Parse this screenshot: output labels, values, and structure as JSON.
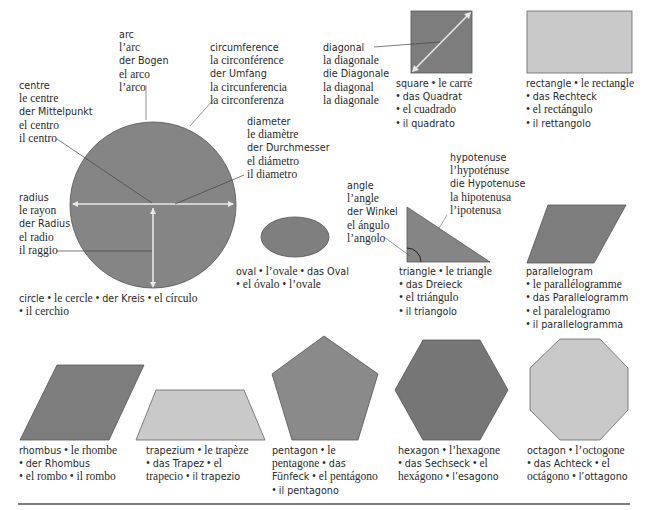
{
  "colors": {
    "dark_fill": "#7d7d7d",
    "medium_fill": "#8c8c8c",
    "light_fill": "#c8c8c8",
    "stroke": "#555555",
    "leader_line": "#444444",
    "arrow": "#e6e6e6",
    "rule": "#555555"
  },
  "circle_parts": {
    "arc": [
      "arc",
      "l’arc",
      "der Bogen",
      "el arco",
      "l’arco"
    ],
    "circumference": [
      "circumference",
      "la circonférence",
      "der Umfang",
      "la circunferencia",
      "la circonferenza"
    ],
    "centre": [
      "centre",
      "le centre",
      "der Mittelpunkt",
      "el centro",
      "il centro"
    ],
    "diameter": [
      "diameter",
      "le diamètre",
      "der Durchmesser",
      "el diámetro",
      "il diametro"
    ],
    "radius": [
      "radius",
      "le rayon",
      "der Radius",
      "el radio",
      "il raggio"
    ]
  },
  "diagonal": [
    "diagonal",
    "la diagonale",
    "die Diagonale",
    "la diagonal",
    "la diagonale"
  ],
  "angle": [
    "angle",
    "l’angle",
    "der Winkel",
    "el ángulo",
    "l’angolo"
  ],
  "hypotenuse": [
    "hypotenuse",
    "l’hypoténuse",
    "die Hypotenuse",
    "la hipotenusa",
    "l’ipotenusa"
  ],
  "shapes": {
    "circle": {
      "en": "circle",
      "fr": "le cercle",
      "de": "der Kreis",
      "es": "el círculo",
      "it": "il cerchio"
    },
    "oval": {
      "en": "oval",
      "fr": "l’ovale",
      "de": "das Oval",
      "es": "el óvalo",
      "it": "l’ovale"
    },
    "square": {
      "en": "square",
      "fr": "le carré",
      "de": "das Quadrat",
      "es": "el cuadrado",
      "it": "il quadrato"
    },
    "rectangle": {
      "en": "rectangle",
      "fr": "le rectangle",
      "de": "das Rechteck",
      "es": "el rectángulo",
      "it": "il rettangolo"
    },
    "triangle": {
      "en": "triangle",
      "fr": "le triangle",
      "de": "das Dreieck",
      "es": "el triángulo",
      "it": "il triangolo"
    },
    "parallelogram": {
      "en": "parallelogram",
      "fr": "le parallélogramme",
      "de": "das Parallelogramm",
      "es": "el paralelogramo",
      "it": "il parallelogramma"
    },
    "rhombus": {
      "en": "rhombus",
      "fr": "le rhombe",
      "de": "der Rhombus",
      "es": "el rombo",
      "it": "il rombo"
    },
    "trapezium": {
      "en": "trapezium",
      "fr": "le trapèze",
      "de": "das Trapez",
      "es": "el",
      "es2": "trapecio",
      "it": "il trapezio"
    },
    "pentagon": {
      "en": "pentagon",
      "fr1": "le",
      "fr2": "pentagone",
      "de1": "das",
      "de2": "Fünfeck",
      "es": "el pentágono",
      "it": "il pentagono"
    },
    "hexagon": {
      "en": "hexagon",
      "fr": "l’hexagone",
      "de": "das Sechseck",
      "es1": "el",
      "es2": "hexágono",
      "it": "l’esagono"
    },
    "octagon": {
      "en": "octagon",
      "fr": "l’octogone",
      "de": "das Achteck",
      "es1": "el",
      "es2": "octágono",
      "it": "l’ottagono"
    }
  },
  "bullet": "•"
}
